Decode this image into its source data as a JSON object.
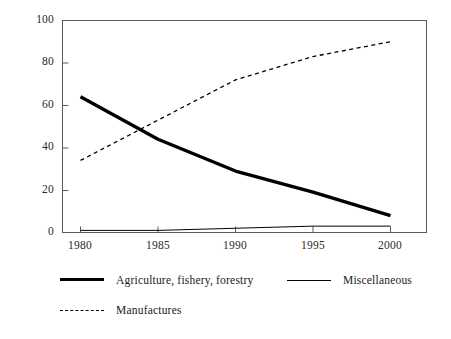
{
  "chart_data": {
    "type": "line",
    "title": "",
    "subtitle": "",
    "xlabel": "",
    "ylabel": "",
    "x": [
      1980,
      1985,
      1990,
      1995,
      2000
    ],
    "xtick_labels": [
      "1980",
      "1985",
      "1990",
      "1995",
      "2000"
    ],
    "ytick_labels": [
      "0",
      "20",
      "40",
      "60",
      "80",
      "100"
    ],
    "ytick_values": [
      0,
      20,
      40,
      60,
      80,
      100
    ],
    "xlim": [
      1978,
      2002
    ],
    "ylim": [
      0,
      100
    ],
    "grid": false,
    "legend_position": "below-plot",
    "series": [
      {
        "name": "Agriculture, fishery, forestry",
        "style": "solid-thick",
        "color": "#000000",
        "values": [
          64,
          44,
          29,
          19,
          8
        ]
      },
      {
        "name": "Manufactures",
        "style": "dashed",
        "color": "#000000",
        "values": [
          34,
          53,
          72,
          83,
          90
        ]
      },
      {
        "name": "Miscellaneous",
        "style": "solid-thin",
        "color": "#000000",
        "values": [
          1,
          1,
          2,
          3,
          3
        ]
      }
    ]
  },
  "legend": {
    "items": [
      {
        "label": "Agriculture, fishery, forestry",
        "swatch": "solid-thick"
      },
      {
        "label": "Miscellaneous",
        "swatch": "solid-thin"
      },
      {
        "label": "Manufactures",
        "swatch": "dashed"
      }
    ]
  },
  "axes": {
    "frame_color": "#5a5a5a",
    "tick_color": "#5a5a5a"
  }
}
